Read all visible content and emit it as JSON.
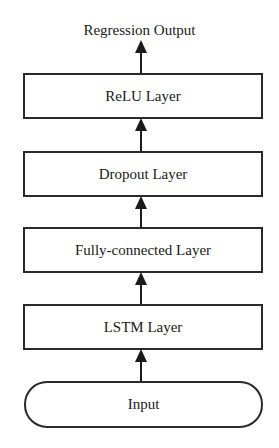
{
  "diagram": {
    "output_label": "Regression Output",
    "layers": [
      {
        "id": "relu",
        "label": "ReLU Layer",
        "shape": "rectangle"
      },
      {
        "id": "dropout",
        "label": "Dropout Layer",
        "shape": "rectangle"
      },
      {
        "id": "fully-connected",
        "label": "Fully-connected Layer",
        "shape": "rectangle"
      },
      {
        "id": "lstm",
        "label": "LSTM Layer",
        "shape": "rectangle"
      },
      {
        "id": "input",
        "label": "Input",
        "shape": "rounded"
      }
    ],
    "flow_direction": "bottom-to-top",
    "colors": {
      "stroke": "#2a2a2a",
      "background": "#ffffff",
      "text": "#1a1a1a"
    }
  }
}
